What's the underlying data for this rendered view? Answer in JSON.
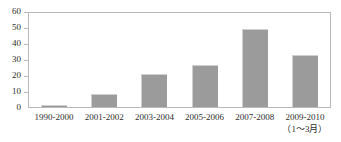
{
  "chart_data": {
    "type": "bar",
    "title": "",
    "subtitle": "",
    "xlabel": "",
    "ylabel": "",
    "categories": [
      "1990-2000",
      "2001-2002",
      "2003-2004",
      "2005-2006",
      "2007-2008",
      "2009-2010"
    ],
    "values": [
      1,
      8,
      21,
      27,
      50,
      33
    ],
    "ylim": [
      0,
      60
    ],
    "ytick_values": [
      0,
      10,
      20,
      30,
      40,
      50,
      60
    ],
    "ytick_labels": [
      "0",
      "10",
      "20",
      "30",
      "40",
      "50",
      "60"
    ],
    "grid": false,
    "legend": "none",
    "annotations": [
      {
        "text": "（1～3月）",
        "attached_to_category": "2009-2010",
        "position": "below-x-tick-label"
      }
    ],
    "series": [
      {
        "name": "",
        "values": [
          1,
          8,
          21,
          27,
          50,
          33
        ],
        "color": "#9b9b9b"
      }
    ]
  },
  "style": {
    "bar_color": "#9b9b9b",
    "bar_edge_color": "#cfcfcf",
    "frame_color": "#b9b9b9",
    "text_color": "#2e2e2e",
    "background": "#ffffff"
  }
}
